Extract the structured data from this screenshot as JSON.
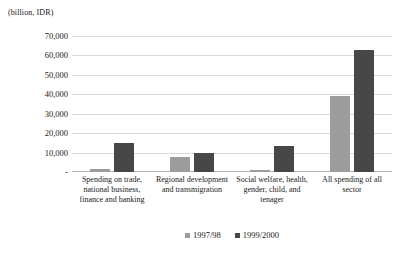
{
  "chart_data": {
    "type": "bar",
    "title": "",
    "subtitle": "",
    "xlabel": "",
    "ylabel": "(billion, IDR)",
    "unit_caption": "(billion, IDR)",
    "ylim": [
      0,
      70000
    ],
    "ytick_labels": [
      "70,000",
      "60,000",
      "50,000",
      "40,000",
      "30,000",
      "20,000",
      "10,000",
      "-"
    ],
    "ytick_values": [
      70000,
      60000,
      50000,
      40000,
      30000,
      20000,
      10000,
      0
    ],
    "grid": true,
    "legend_position": "bottom",
    "categories": [
      "Spending on trade, national business, finance and banking",
      "Regional development and transmigration",
      "Social welfare, health, gender, child, and tenager",
      "All spending of all sector"
    ],
    "series": [
      {
        "name": "1997/98",
        "color": "#9c9c9c",
        "values": [
          1500,
          7700,
          1200,
          39000
        ]
      },
      {
        "name": "1999/2000",
        "color": "#474747",
        "values": [
          15000,
          9800,
          13500,
          63000
        ]
      }
    ]
  }
}
